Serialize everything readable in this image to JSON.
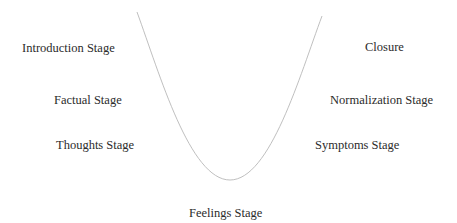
{
  "diagram": {
    "type": "u-curve",
    "curve_color": "#b8b8b8",
    "left_labels": [
      {
        "text": "Introduction Stage"
      },
      {
        "text": "Factual Stage"
      },
      {
        "text": "Thoughts Stage"
      }
    ],
    "right_labels": [
      {
        "text": "Closure"
      },
      {
        "text": "Normalization Stage"
      },
      {
        "text": "Symptoms Stage"
      }
    ],
    "bottom_label": {
      "text": "Feelings Stage"
    }
  }
}
